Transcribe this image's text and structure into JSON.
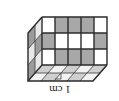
{
  "figure": {
    "name": "unit-cube-cuboid-isometric",
    "rotation_degrees": 180,
    "dimension_label": "1 cm",
    "background_color": "#ffffff",
    "colors": {
      "cell_white": "#ffffff",
      "cell_gray": "#a8a8a8",
      "top_face_white": "#f2f2f2",
      "top_face_gray": "#cfcfcf",
      "side_face_white": "#e8e8e8",
      "side_face_gray": "#9c9c9c",
      "edge_stroke": "#3a3a3a",
      "outline_stroke": "#2b2b2b",
      "label_text": "#1a1a1a"
    },
    "solid": {
      "columns": 5,
      "rows": 3,
      "depth": 2
    },
    "front_face": {
      "columns": 5,
      "rows": 3,
      "pattern": [
        [
          "white",
          "gray",
          "gray",
          "gray",
          "white"
        ],
        [
          "gray",
          "white",
          "white",
          "white",
          "gray"
        ],
        [
          "white",
          "gray",
          "gray",
          "gray",
          "white"
        ]
      ]
    },
    "side_face": {
      "columns": 2,
      "rows": 3,
      "pattern": [
        [
          "gray",
          "white"
        ],
        [
          "white",
          "gray"
        ],
        [
          "gray",
          "white"
        ]
      ]
    },
    "top_face": {
      "columns": 5,
      "rows": 2,
      "pattern": [
        [
          "white",
          "gray",
          "white",
          "gray",
          "white"
        ],
        [
          "gray",
          "white",
          "gray",
          "white",
          "gray"
        ]
      ]
    }
  }
}
